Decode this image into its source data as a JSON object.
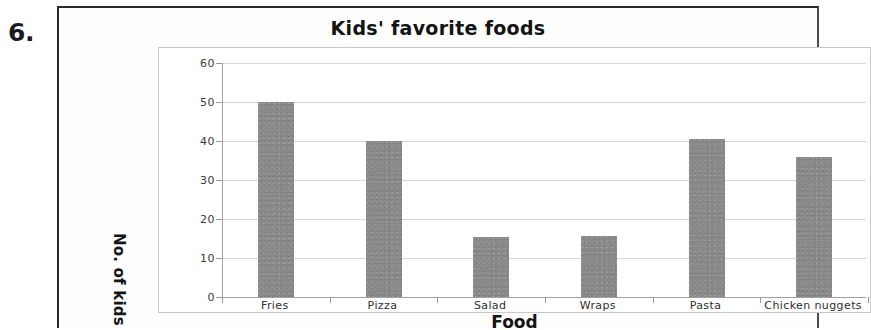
{
  "worksheet": {
    "question_number": "6."
  },
  "chart_data": {
    "type": "bar",
    "title": "Kids' favorite foods",
    "xlabel": "Food",
    "ylabel": "No. of kids",
    "categories": [
      "Fries",
      "Pizza",
      "Salad",
      "Wraps",
      "Pasta",
      "Chicken nuggets"
    ],
    "values": [
      50,
      40,
      15.4,
      15.6,
      40.5,
      36
    ],
    "ylim": [
      0,
      60
    ],
    "yticks": [
      0,
      10,
      20,
      30,
      40,
      50,
      60
    ],
    "ytick_labels": [
      "0",
      "10",
      "20",
      "30",
      "40",
      "50",
      "60"
    ],
    "grid": true,
    "legend": false,
    "bar_color": "#8a8a8a",
    "gridline_color": "#d7d7d7",
    "axis_color": "#a0a0a0",
    "plot_background": "#ffffff"
  }
}
